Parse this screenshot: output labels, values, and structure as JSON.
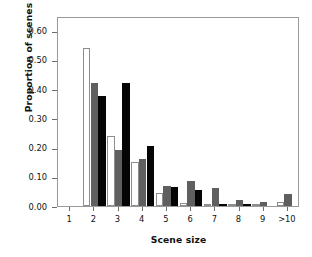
{
  "chart_data": {
    "type": "bar",
    "title": "",
    "xlabel": "Scene size",
    "ylabel": "Proportion of scenes",
    "categories": [
      "1",
      "2",
      "3",
      "4",
      "5",
      "6",
      "7",
      "8",
      "9",
      ">10"
    ],
    "ylim": [
      0.0,
      0.65
    ],
    "ytick_labels": [
      "0.00",
      "0.10",
      "0.20",
      "0.30",
      "0.40",
      "0.50",
      "0.60"
    ],
    "ytick_values": [
      0.0,
      0.1,
      0.2,
      0.3,
      0.4,
      0.5,
      0.6
    ],
    "grid": false,
    "legend": "none",
    "series": [
      {
        "name": "white",
        "color": "#ffffff",
        "edge_color": "#8d8d8d",
        "values": [
          0.0,
          0.54,
          0.24,
          0.15,
          0.045,
          0.01,
          0.005,
          0.005,
          0.005,
          0.015
        ]
      },
      {
        "name": "gray",
        "color": "#5f5f5f",
        "edge_color": "#5f5f5f",
        "values": [
          0.0,
          0.42,
          0.19,
          0.16,
          0.07,
          0.085,
          0.06,
          0.02,
          0.015,
          0.04
        ]
      },
      {
        "name": "black",
        "color": "#050505",
        "edge_color": "#050505",
        "values": [
          0.0,
          0.375,
          0.42,
          0.205,
          0.065,
          0.055,
          0.005,
          0.005,
          0.0,
          0.0
        ]
      }
    ]
  },
  "axis": {
    "frame_color": "#9a9a9a",
    "tick_color": "#6d6d6d",
    "text_color": "#111111"
  }
}
